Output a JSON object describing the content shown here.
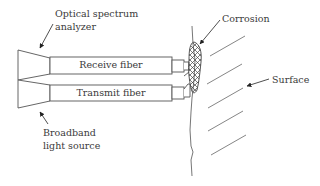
{
  "diagram": {
    "type": "fiber-optic corrosion sensor schematic",
    "labels": {
      "analyzer_line1": "Optical spectrum",
      "analyzer_line2": "analyzer",
      "corrosion": "Corrosion",
      "surface": "Surface",
      "source_line1": "Broadband",
      "source_line2": "light source"
    },
    "fibers": [
      {
        "id": "receive",
        "label": "Receive fiber"
      },
      {
        "id": "transmit",
        "label": "Transmit fiber"
      }
    ],
    "colors": {
      "stroke": "#555555",
      "text": "#3a3a3a",
      "hatch": "#777777",
      "background": "#ffffff"
    }
  }
}
